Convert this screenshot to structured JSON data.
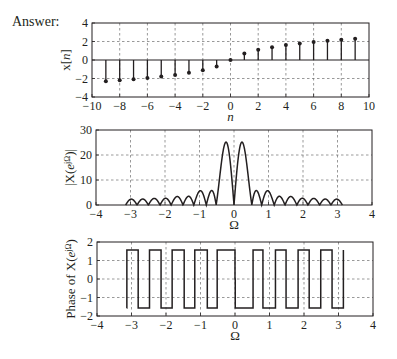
{
  "answer_label": "Answer:",
  "colors": {
    "line": "#231f20",
    "grid": "#6d6d6d",
    "background": "#ffffff"
  },
  "chart_data": [
    {
      "id": "stem",
      "type": "stem",
      "frame": {
        "left": 92,
        "right": 369,
        "top": 23,
        "bottom": 97
      },
      "xlim": [
        -10,
        10
      ],
      "ylim": [
        -4,
        4
      ],
      "xticks": [
        -10,
        -8,
        -6,
        -4,
        -2,
        0,
        2,
        4,
        6,
        8,
        10
      ],
      "yticks": [
        -4,
        -2,
        0,
        2,
        4
      ],
      "xgrid": [
        -8,
        -6,
        -4,
        -2,
        0,
        2,
        4,
        6,
        8
      ],
      "ygrid": [
        -2,
        2
      ],
      "zero_line": true,
      "xlabel": "n",
      "ylabel": "x[n]",
      "n": [
        -9,
        -8,
        -7,
        -6,
        -5,
        -4,
        -3,
        -2,
        -1,
        0,
        1,
        2,
        3,
        4,
        5,
        6,
        7,
        8,
        9
      ],
      "values": [
        -2.3,
        -2.2,
        -2.08,
        -1.95,
        -1.79,
        -1.61,
        -1.39,
        -1.1,
        -0.69,
        0,
        0.69,
        1.1,
        1.39,
        1.61,
        1.79,
        1.95,
        2.08,
        2.2,
        2.3
      ]
    },
    {
      "id": "magnitude",
      "type": "line",
      "frame": {
        "left": 96,
        "right": 372,
        "top": 130,
        "bottom": 205
      },
      "xlim": [
        -4,
        4
      ],
      "ylim": [
        0,
        30
      ],
      "xticks": [
        -4,
        -3,
        -2,
        -1,
        0,
        1,
        2,
        3,
        4
      ],
      "yticks": [
        0,
        10,
        20,
        30
      ],
      "xgrid": [
        -3,
        -2,
        -1,
        0,
        1,
        2,
        3
      ],
      "ygrid": [
        10,
        20
      ],
      "xlabel": "Ω",
      "ylabel": "|X(e^jΩ)|",
      "omega_range": [
        -3.1416,
        3.1416
      ],
      "samples": 900,
      "derived_from": "stem",
      "main_lobe_peaks": [
        [
          -0.2,
          25
        ],
        [
          0.2,
          25
        ]
      ],
      "side_lobe_peaks_approx": [
        [
          -1.0,
          6
        ],
        [
          -0.65,
          6
        ],
        [
          0.65,
          6
        ],
        [
          1.0,
          6
        ],
        [
          -3.0,
          2.5
        ],
        [
          3.0,
          2.5
        ]
      ]
    },
    {
      "id": "phase",
      "type": "line",
      "frame": {
        "left": 97,
        "right": 373,
        "top": 242,
        "bottom": 316
      },
      "xlim": [
        -4,
        4
      ],
      "ylim": [
        -2,
        2
      ],
      "xticks": [
        -4,
        -3,
        -2,
        -1,
        0,
        1,
        2,
        3,
        4
      ],
      "yticks": [
        -2,
        -1,
        0,
        1,
        2
      ],
      "xgrid": [
        -3,
        -2,
        -1,
        0,
        1,
        2,
        3
      ],
      "ygrid": [
        -1,
        0,
        1
      ],
      "xlabel": "Ω",
      "ylabel": "Phase of X(e^jΩ)",
      "omega_range": [
        -3.1416,
        3.1416
      ],
      "samples": 900,
      "derived_from": "stem",
      "levels": [
        -1.5708,
        1.5708
      ]
    }
  ]
}
